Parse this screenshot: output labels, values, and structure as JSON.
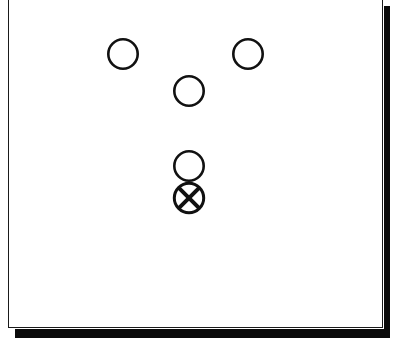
{
  "diagram": {
    "type": "player-formation",
    "colors": {
      "stroke": "#111111",
      "background": "#ffffff",
      "shadow": "#0a0a0a"
    },
    "players": [
      {
        "id": "o1",
        "symbol": "circle",
        "cx": 123,
        "cy": 54,
        "r": 16
      },
      {
        "id": "o2",
        "symbol": "circle",
        "cx": 248,
        "cy": 54,
        "r": 16
      },
      {
        "id": "o3",
        "symbol": "circle",
        "cx": 189,
        "cy": 91,
        "r": 16
      },
      {
        "id": "o4",
        "symbol": "circle",
        "cx": 189,
        "cy": 166,
        "r": 16
      },
      {
        "id": "x1",
        "symbol": "crossed-circle",
        "cx": 189,
        "cy": 198,
        "r": 16
      }
    ]
  }
}
